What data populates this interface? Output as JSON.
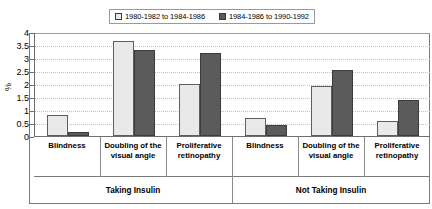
{
  "chart_data": {
    "type": "bar",
    "title": "",
    "xlabel": "",
    "ylabel": "%",
    "ylim": [
      0,
      4
    ],
    "ytick_values": [
      0,
      0.5,
      1,
      1.5,
      2,
      2.5,
      3,
      3.5,
      4
    ],
    "ytick_labels": [
      "0",
      "0.5",
      "1",
      "1.5",
      "2",
      "2.5",
      "3",
      "3.5",
      "4"
    ],
    "grid": true,
    "legend_position": "top-center",
    "groups": [
      "Taking Insulin",
      "Not Taking Insulin"
    ],
    "categories": [
      "Blindness",
      "Doubling of the visual angle",
      "Proliferative retinopathy",
      "Blindness",
      "Doubling of the visual angle",
      "Proliferative retinopathy"
    ],
    "series": [
      {
        "name": "1980-1982 to 1984-1986",
        "color": "#e9e9e9",
        "values": [
          0.82,
          3.65,
          2.0,
          0.7,
          1.93,
          0.57
        ]
      },
      {
        "name": "1984-1986 to 1990-1992",
        "color": "#5b5b5b",
        "values": [
          0.15,
          3.3,
          3.18,
          0.42,
          2.55,
          1.38
        ]
      }
    ]
  },
  "legend": {
    "entries": [
      {
        "label": "1980-1982 to 1984-1986"
      },
      {
        "label": "1984-1986 to 1990-1992"
      }
    ]
  },
  "axis": {
    "y_title": "%"
  }
}
